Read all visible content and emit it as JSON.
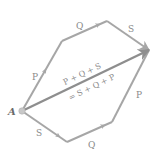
{
  "diagram": {
    "origin": {
      "label": "A",
      "x": 22,
      "y": 111
    },
    "colors": {
      "vector": "#a6a6a6",
      "resultant": "#8e8e8e",
      "label": "#8a8a8a",
      "origin_dot": "#c8c8c8"
    },
    "top_path": [
      {
        "label": "P",
        "from": [
          22,
          111
        ],
        "to": [
          62,
          41
        ],
        "label_pos": [
          33,
          78
        ]
      },
      {
        "label": "Q",
        "from": [
          62,
          41
        ],
        "to": [
          107,
          21
        ],
        "label_pos": [
          79,
          27
        ]
      },
      {
        "label": "S",
        "from": [
          107,
          21
        ],
        "to": [
          149,
          50
        ],
        "label_pos": [
          131,
          30
        ]
      }
    ],
    "bottom_path": [
      {
        "label": "S",
        "from": [
          22,
          111
        ],
        "to": [
          67,
          142
        ],
        "label_pos": [
          38,
          134
        ]
      },
      {
        "label": "Q",
        "from": [
          67,
          142
        ],
        "to": [
          112,
          122
        ],
        "label_pos": [
          91,
          146
        ]
      },
      {
        "label": "P",
        "from": [
          112,
          122
        ],
        "to": [
          149,
          50
        ],
        "label_pos": [
          139,
          96
        ]
      }
    ],
    "resultant": {
      "from": [
        22,
        111
      ],
      "to": [
        149,
        50
      ],
      "label_line1": "P + Q + S",
      "label_line2": "= S + Q + P"
    }
  }
}
